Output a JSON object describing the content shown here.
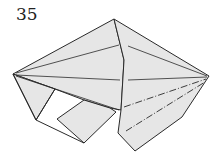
{
  "step_number": "35",
  "colors": {
    "paper": "#e6e6e6",
    "line": "#2a2a2a",
    "background": "#ffffff"
  },
  "legend": {
    "mountain_fold": "dash-dot line",
    "valley_fold": "dashed line"
  }
}
